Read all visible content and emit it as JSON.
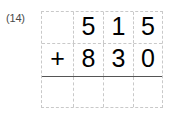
{
  "problem": {
    "label": "(14)",
    "operation_symbol": "+",
    "columns": [
      "operator",
      "hundreds",
      "tens",
      "ones"
    ],
    "rows": [
      {
        "name": "first-addend",
        "operator": "",
        "digits": [
          "5",
          "1",
          "5"
        ],
        "value": "515"
      },
      {
        "name": "second-addend",
        "operator": "+",
        "digits": [
          "8",
          "3",
          "0"
        ],
        "value": "830"
      },
      {
        "name": "sum",
        "operator": "",
        "digits": [
          "",
          "",
          ""
        ],
        "value": ""
      }
    ]
  },
  "colors": {
    "ink": "#000000",
    "label_ink": "#4a4a4a",
    "gridline": "#c9c9c9",
    "answer_rule": "#555555",
    "page_background": "#ffffff"
  }
}
